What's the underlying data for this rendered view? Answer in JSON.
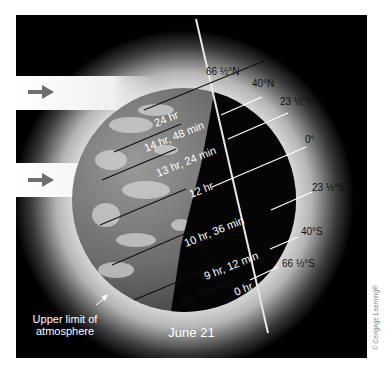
{
  "diagram": {
    "title": "June 21",
    "annotation": "Upper limit of atmosphere",
    "annotation_lines": [
      "Upper limit of",
      "atmosphere"
    ],
    "credit": "© Cengage Learning®",
    "incoming_light_arrows": 2,
    "latitudes": [
      {
        "label": "66 ½°N",
        "daylight": "24 hr"
      },
      {
        "label": "40°N",
        "daylight": "14 hr, 48 min"
      },
      {
        "label": "23 ½°N",
        "daylight": "13 hr, 24 min"
      },
      {
        "label": "0°",
        "daylight": "12 hr"
      },
      {
        "label": "23 ½°S",
        "daylight": "10 hr, 36 min"
      },
      {
        "label": "40°S",
        "daylight": "9 hr, 12 min"
      },
      {
        "label": "66 ½°S",
        "daylight": "0 hr"
      }
    ],
    "colors": {
      "background": "#000000",
      "atmosphere_glow": "#d8d8d8",
      "arrow": "#6e6e6e",
      "lat_line_day": "#111111",
      "lat_line_night": "#ffffff"
    }
  }
}
